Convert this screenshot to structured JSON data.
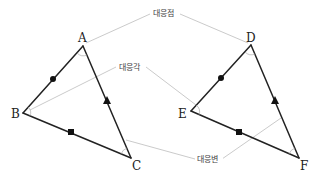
{
  "diagram": {
    "type": "congruent-triangles",
    "colors": {
      "edge": "#222222",
      "leader": "#bdbdbd",
      "label_text": "#444444",
      "marker": "#111111",
      "background": "#ffffff"
    },
    "triangle_1": {
      "vertices": {
        "A": {
          "label": "A",
          "x": 83,
          "y": 46
        },
        "B": {
          "label": "B",
          "x": 23,
          "y": 113
        },
        "C": {
          "label": "C",
          "x": 131,
          "y": 158
        }
      },
      "side_markers": {
        "AB": "circle",
        "AC": "triangle",
        "BC": "square"
      }
    },
    "triangle_2": {
      "vertices": {
        "D": {
          "label": "D",
          "x": 251,
          "y": 45
        },
        "E": {
          "label": "E",
          "x": 191,
          "y": 111
        },
        "F": {
          "label": "F",
          "x": 299,
          "y": 158
        }
      },
      "side_markers": {
        "DE": "circle",
        "DF": "triangle",
        "EF": "square"
      }
    },
    "callouts": {
      "corresponding_points": {
        "label": "대응점",
        "targets": [
          "A",
          "D"
        ]
      },
      "corresponding_angles": {
        "label": "대응각",
        "targets": [
          "B",
          "E"
        ]
      },
      "corresponding_sides": {
        "label": "대응변",
        "targets": [
          "AC",
          "DF"
        ]
      }
    }
  }
}
